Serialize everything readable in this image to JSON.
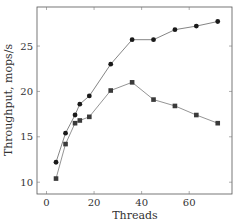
{
  "chart_data": {
    "type": "line",
    "title": "",
    "xlabel": "Threads",
    "ylabel": "Throughput, mops/s",
    "xlim": [
      -4,
      78
    ],
    "ylim": [
      8.7,
      29.3
    ],
    "xticks": [
      0,
      20,
      40,
      60
    ],
    "yticks": [
      10,
      15,
      20,
      25
    ],
    "grid": false,
    "legend": null,
    "x": [
      4,
      8,
      12,
      14,
      18,
      27,
      36,
      45,
      54,
      63,
      72
    ],
    "series": [
      {
        "name": "circle-series",
        "marker": "circle",
        "color": "#1a1a1a",
        "line_color": "#777777",
        "values": [
          12.2,
          15.4,
          17.4,
          18.6,
          19.5,
          23.0,
          25.7,
          25.7,
          26.8,
          27.2,
          27.7
        ]
      },
      {
        "name": "square-series",
        "marker": "square",
        "color": "#3a3a3a",
        "line_color": "#888888",
        "values": [
          10.4,
          14.2,
          16.5,
          16.8,
          17.2,
          20.1,
          21.0,
          19.1,
          18.4,
          17.4,
          16.5
        ]
      }
    ]
  }
}
